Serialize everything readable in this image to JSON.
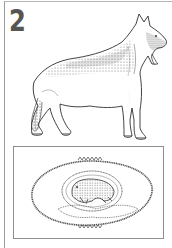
{
  "card": {
    "number": "2",
    "subject": "German Shepherd dog",
    "illustration_main": "dog-standing-side-view",
    "illustration_panel": "puppy-embryo-in-oval-placenta"
  },
  "colors": {
    "ink": "#333333",
    "number": "#555555",
    "frame": "#9a9a9a",
    "background": "#ffffff"
  }
}
